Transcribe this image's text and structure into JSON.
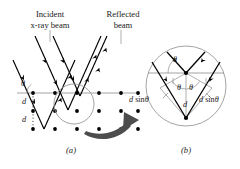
{
  "figure": {
    "title_a": "Bragg diffraction of x-rays from crystal planes",
    "panels": [
      {
        "id": "a",
        "caption": "(a)"
      },
      {
        "id": "b",
        "caption": "(b)"
      }
    ]
  },
  "panel_a": {
    "labels": {
      "incident_line1": "Incident",
      "incident_line2": "x-ray beam",
      "reflected_line1": "Reflected",
      "reflected_line2": "beam",
      "angle": "θ",
      "spacing_1": "d",
      "spacing_2": "d"
    },
    "lattice": {
      "rows": 3,
      "cols": 6,
      "dot_color": "#000000",
      "row_spacing": 18,
      "col_spacing": 22
    },
    "rays": {
      "incident_count": 3,
      "reflected_count": 3,
      "color": "#000000"
    },
    "highlight_circle_color": "#9a9a9a",
    "plane_line_color": "#8c8c8c",
    "zoom_arrow_color": "#4d4d4d",
    "caption": "(a)"
  },
  "panel_b": {
    "labels": {
      "angle_top": "θ",
      "angle_left": "θ",
      "angle_right": "θ",
      "spacing": "d",
      "path_left_var": "d",
      "path_left_fn": "sin",
      "path_left_angle": "θ",
      "path_right_var": "d",
      "path_right_fn": "sin",
      "path_right_angle": "θ"
    },
    "circle_color": "#9a9a9a",
    "ray_color": "#000000",
    "construction_color": "#8c8c8c",
    "caption": "(b)"
  },
  "colors": {
    "background": "#ffffff",
    "ink": "#000000",
    "gray_line": "#8c8c8c",
    "circle_gray": "#9a9a9a",
    "arrow_gray": "#4d4d4d"
  }
}
